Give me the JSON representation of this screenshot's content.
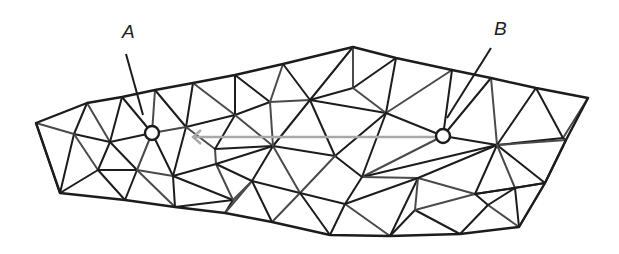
{
  "figure": {
    "type": "triangulated-mesh"
  },
  "colors": {
    "edge_dark": "#1c1c1c",
    "edge_mid": "#4a4a4a",
    "path_line": "#a8a8a8",
    "background": "#ffffff",
    "label": "#222222"
  },
  "labels": {
    "A": {
      "text": "A",
      "x": 122,
      "y": 38,
      "leader": [
        [
          126,
          54
        ],
        [
          143,
          115
        ]
      ]
    },
    "B": {
      "text": "B",
      "x": 494,
      "y": 35,
      "leader": [
        [
          491,
          48
        ],
        [
          447,
          118
        ]
      ]
    }
  },
  "markers": [
    {
      "id": "A",
      "x": 152,
      "y": 133,
      "r": 7
    },
    {
      "id": "B",
      "x": 443,
      "y": 136,
      "r": 7
    }
  ],
  "path_line": {
    "from": [
      193,
      137
    ],
    "to": [
      436,
      137
    ],
    "arrow_at": "start"
  },
  "vertices": {
    "O1": [
      36,
      123
    ],
    "O2": [
      87,
      103
    ],
    "O3": [
      122,
      97
    ],
    "O4": [
      155,
      90
    ],
    "O5": [
      193,
      83
    ],
    "O6": [
      235,
      75
    ],
    "O7": [
      283,
      64
    ],
    "O8": [
      353,
      47
    ],
    "O9": [
      396,
      58
    ],
    "O10": [
      452,
      70
    ],
    "O11": [
      491,
      78
    ],
    "O12": [
      536,
      88
    ],
    "O13": [
      588,
      98
    ],
    "O14": [
      566,
      140
    ],
    "O15": [
      545,
      183
    ],
    "O16": [
      519,
      227
    ],
    "O17": [
      460,
      234
    ],
    "O18": [
      390,
      236
    ],
    "O19": [
      330,
      235
    ],
    "O20": [
      272,
      222
    ],
    "O21": [
      225,
      213
    ],
    "O22": [
      175,
      207
    ],
    "O23": [
      125,
      200
    ],
    "O24": [
      60,
      193
    ],
    "P1": [
      74,
      134
    ],
    "P2": [
      110,
      142
    ],
    "A": [
      152,
      133
    ],
    "P3": [
      186,
      127
    ],
    "P4": [
      235,
      115
    ],
    "P5": [
      270,
      102
    ],
    "P6": [
      310,
      100
    ],
    "P7": [
      353,
      88
    ],
    "P8": [
      386,
      113
    ],
    "B": [
      443,
      136
    ],
    "P9": [
      497,
      145
    ],
    "P10": [
      563,
      138
    ],
    "P11": [
      98,
      170
    ],
    "P12": [
      137,
      170
    ],
    "P13": [
      173,
      176
    ],
    "P14": [
      216,
      164
    ],
    "P15": [
      252,
      181
    ],
    "P16": [
      273,
      146
    ],
    "P17": [
      335,
      156
    ],
    "P18": [
      362,
      177
    ],
    "P19": [
      418,
      178
    ],
    "P20": [
      475,
      194
    ],
    "P21": [
      515,
      188
    ],
    "P22": [
      545,
      183
    ],
    "Q1": [
      215,
      149
    ],
    "Q2": [
      233,
      200
    ],
    "Q3": [
      300,
      193
    ],
    "Q4": [
      345,
      204
    ],
    "Q5": [
      415,
      210
    ],
    "Q6": [
      488,
      205
    ]
  },
  "boundary": [
    "O1",
    "O2",
    "O3",
    "O4",
    "O5",
    "O6",
    "O7",
    "O8",
    "O9",
    "O10",
    "O11",
    "O12",
    "O13",
    "O14",
    "O15",
    "O16",
    "O17",
    "O18",
    "O19",
    "O20",
    "O21",
    "O22",
    "O23",
    "O24"
  ],
  "edges": [
    [
      "O1",
      "P1"
    ],
    [
      "O1",
      "O24"
    ],
    [
      "O2",
      "P1"
    ],
    [
      "O2",
      "P2"
    ],
    [
      "O3",
      "P2"
    ],
    [
      "O3",
      "A"
    ],
    [
      "O4",
      "A"
    ],
    [
      "O4",
      "P3"
    ],
    [
      "O5",
      "P3"
    ],
    [
      "O5",
      "P4"
    ],
    [
      "O6",
      "P4"
    ],
    [
      "O6",
      "P5"
    ],
    [
      "O7",
      "P5"
    ],
    [
      "O7",
      "P6"
    ],
    [
      "O8",
      "P6"
    ],
    [
      "O8",
      "P7"
    ],
    [
      "O9",
      "P7"
    ],
    [
      "O9",
      "P8"
    ],
    [
      "O10",
      "P8"
    ],
    [
      "O10",
      "B"
    ],
    [
      "O11",
      "B"
    ],
    [
      "O11",
      "P9"
    ],
    [
      "O12",
      "P9"
    ],
    [
      "O12",
      "P10"
    ],
    [
      "O13",
      "P10"
    ],
    [
      "P10",
      "O14"
    ],
    [
      "P9",
      "P10"
    ],
    [
      "P9",
      "O14"
    ],
    [
      "P9",
      "P22"
    ],
    [
      "P22",
      "O14"
    ],
    [
      "P22",
      "O15"
    ],
    [
      "P1",
      "P2"
    ],
    [
      "P2",
      "A"
    ],
    [
      "A",
      "P3"
    ],
    [
      "P3",
      "P4"
    ],
    [
      "P4",
      "P5"
    ],
    [
      "P5",
      "P6"
    ],
    [
      "P6",
      "P7"
    ],
    [
      "P1",
      "O24"
    ],
    [
      "P1",
      "P11"
    ],
    [
      "P2",
      "P11"
    ],
    [
      "P2",
      "P12"
    ],
    [
      "A",
      "P12"
    ],
    [
      "A",
      "P13"
    ],
    [
      "P3",
      "P13"
    ],
    [
      "P3",
      "Q1"
    ],
    [
      "P11",
      "O24"
    ],
    [
      "P11",
      "P12"
    ],
    [
      "P12",
      "P13"
    ],
    [
      "P11",
      "O23"
    ],
    [
      "P12",
      "O23"
    ],
    [
      "P12",
      "O22"
    ],
    [
      "P13",
      "O22"
    ],
    [
      "P13",
      "P14"
    ],
    [
      "P14",
      "Q1"
    ],
    [
      "P14",
      "P16"
    ],
    [
      "P4",
      "Q1"
    ],
    [
      "P4",
      "P16"
    ],
    [
      "Q1",
      "P16"
    ],
    [
      "P13",
      "Q2"
    ],
    [
      "P14",
      "Q2"
    ],
    [
      "Q2",
      "O22"
    ],
    [
      "Q2",
      "O21"
    ],
    [
      "Q2",
      "P15"
    ],
    [
      "P14",
      "P15"
    ],
    [
      "P15",
      "P16"
    ],
    [
      "P15",
      "O21"
    ],
    [
      "P15",
      "O20"
    ],
    [
      "P15",
      "Q3"
    ],
    [
      "P16",
      "Q3"
    ],
    [
      "P16",
      "P17"
    ],
    [
      "P16",
      "P6"
    ],
    [
      "P16",
      "P5"
    ],
    [
      "P6",
      "P17"
    ],
    [
      "P6",
      "P8"
    ],
    [
      "P7",
      "P8"
    ],
    [
      "P17",
      "P8"
    ],
    [
      "P17",
      "P18"
    ],
    [
      "P17",
      "Q3"
    ],
    [
      "P8",
      "B"
    ],
    [
      "P8",
      "P18"
    ],
    [
      "B",
      "P18"
    ],
    [
      "B",
      "P9"
    ],
    [
      "P18",
      "P9"
    ],
    [
      "P18",
      "P19"
    ],
    [
      "P18",
      "Q4"
    ],
    [
      "Q3",
      "Q4"
    ],
    [
      "Q3",
      "O20"
    ],
    [
      "Q3",
      "O19"
    ],
    [
      "Q4",
      "O19"
    ],
    [
      "Q4",
      "O18"
    ],
    [
      "Q4",
      "P19"
    ],
    [
      "P19",
      "O18"
    ],
    [
      "P19",
      "Q5"
    ],
    [
      "Q5",
      "O18"
    ],
    [
      "Q5",
      "O17"
    ],
    [
      "P19",
      "P20"
    ],
    [
      "P19",
      "P9"
    ],
    [
      "P20",
      "P9"
    ],
    [
      "P20",
      "Q5"
    ],
    [
      "P20",
      "Q6"
    ],
    [
      "Q6",
      "O17"
    ],
    [
      "Q6",
      "O16"
    ],
    [
      "Q6",
      "P21"
    ],
    [
      "P20",
      "P21"
    ],
    [
      "P21",
      "P9"
    ],
    [
      "P21",
      "P22"
    ],
    [
      "P21",
      "O16"
    ],
    [
      "P22",
      "O16"
    ],
    [
      "P20",
      "P22"
    ]
  ]
}
